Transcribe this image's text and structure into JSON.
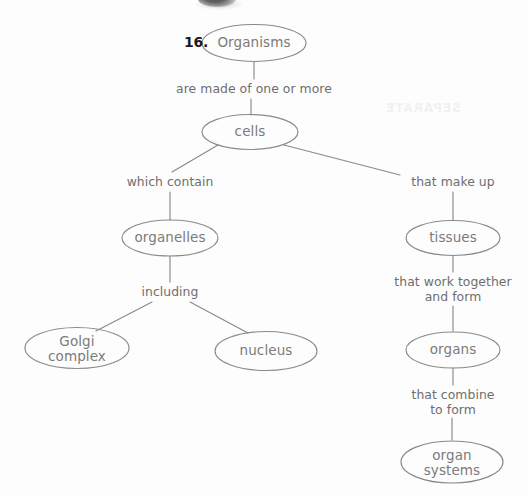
{
  "page": {
    "item_number": "16.",
    "background_color": "#fdfdfd",
    "ink_color": "#7b7b7b",
    "text_color": "#6e6e6e",
    "number_color": "#1b1b1b"
  },
  "diagram": {
    "type": "concept-map",
    "nodes": [
      {
        "id": "organisms",
        "label": "Organisms",
        "cx": 254,
        "cy": 43,
        "rx": 52,
        "ry": 18
      },
      {
        "id": "cells",
        "label": "cells",
        "cx": 250,
        "cy": 132,
        "rx": 48,
        "ry": 17
      },
      {
        "id": "organelles",
        "label": "organelles",
        "cx": 170,
        "cy": 238,
        "rx": 48,
        "ry": 18
      },
      {
        "id": "golgi-complex",
        "label": "Golgi\ncomplex",
        "cx": 77,
        "cy": 348,
        "rx": 52,
        "ry": 20
      },
      {
        "id": "nucleus",
        "label": "nucleus",
        "cx": 266,
        "cy": 351,
        "rx": 51,
        "ry": 19
      },
      {
        "id": "tissues",
        "label": "tissues",
        "cx": 453,
        "cy": 238,
        "rx": 47,
        "ry": 17
      },
      {
        "id": "organs",
        "label": "organs",
        "cx": 453,
        "cy": 350,
        "rx": 47,
        "ry": 18
      },
      {
        "id": "organ-systems",
        "label": "organ\nsystems",
        "cx": 452,
        "cy": 462,
        "rx": 51,
        "ry": 21
      }
    ],
    "link_labels": [
      {
        "id": "are-made-of-one-or-more",
        "text": "are made of one or more",
        "x": 254,
        "y": 89,
        "width": 200
      },
      {
        "id": "which-contain",
        "text": "which contain",
        "x": 170,
        "y": 182,
        "width": 120
      },
      {
        "id": "that-make-up",
        "text": "that make up",
        "x": 453,
        "y": 182,
        "width": 120
      },
      {
        "id": "including",
        "text": "including",
        "x": 170,
        "y": 292,
        "width": 100
      },
      {
        "id": "that-work-together-and-form",
        "text": "that work together\nand form",
        "x": 453,
        "y": 285,
        "width": 140
      },
      {
        "id": "that-combine-to-form",
        "text": "that combine\nto form",
        "x": 453,
        "y": 397,
        "width": 120
      }
    ],
    "edges": [
      {
        "id": "organisms-to-label1",
        "from": "organisms",
        "to": "are-made-of-one-or-more",
        "kind": "vertical"
      },
      {
        "id": "label1-to-cells",
        "from": "are-made-of-one-or-more",
        "to": "cells",
        "kind": "vertical"
      },
      {
        "id": "cells-to-which-contain",
        "from": "cells",
        "to": "which-contain",
        "kind": "diagonal"
      },
      {
        "id": "cells-to-that-make-up",
        "from": "cells",
        "to": "that-make-up",
        "kind": "diagonal"
      },
      {
        "id": "which-contain-to-organelles",
        "from": "which-contain",
        "to": "organelles",
        "kind": "vertical"
      },
      {
        "id": "organelles-to-including",
        "from": "organelles",
        "to": "including",
        "kind": "vertical"
      },
      {
        "id": "including-to-golgi",
        "from": "including",
        "to": "golgi-complex",
        "kind": "diagonal"
      },
      {
        "id": "including-to-nucleus",
        "from": "including",
        "to": "nucleus",
        "kind": "diagonal"
      },
      {
        "id": "that-make-up-to-tissues",
        "from": "that-make-up",
        "to": "tissues",
        "kind": "vertical"
      },
      {
        "id": "tissues-to-work-together",
        "from": "tissues",
        "to": "that-work-together-and-form",
        "kind": "vertical"
      },
      {
        "id": "work-together-to-organs",
        "from": "that-work-together-and-form",
        "to": "organs",
        "kind": "vertical"
      },
      {
        "id": "organs-to-combine",
        "from": "organs",
        "to": "that-combine-to-form",
        "kind": "vertical"
      },
      {
        "id": "combine-to-organ-systems",
        "from": "that-combine-to-form",
        "to": "organ-systems",
        "kind": "vertical"
      }
    ]
  },
  "artifacts": {
    "ghost_text": "SEPARATE",
    "smudge_present": true
  }
}
